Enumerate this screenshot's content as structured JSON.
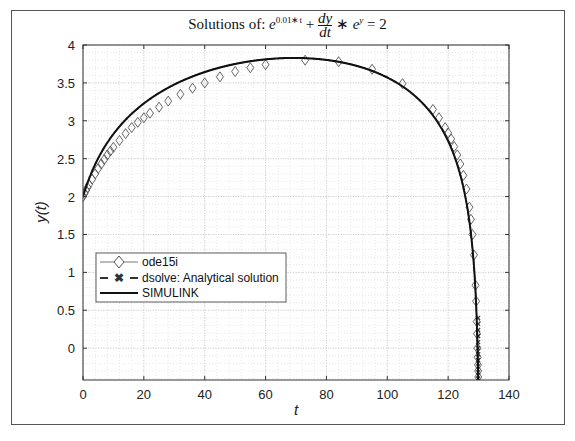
{
  "chart_data": {
    "type": "line",
    "title_parts": {
      "prefix": "Solutions of:",
      "e_base": "e",
      "exp1": "0.01∗t",
      "plus": "+",
      "num": "dy",
      "den": "dt",
      "times": "∗",
      "e2": "e",
      "exp2": "y",
      "eq": "= 2"
    },
    "xlabel": "t",
    "ylabel": "y(t)",
    "xlim": [
      0,
      140
    ],
    "ylim": [
      -0.42,
      4
    ],
    "xticks": [
      0,
      20,
      40,
      60,
      80,
      100,
      120,
      140
    ],
    "yticks": [
      0,
      0.5,
      1,
      1.5,
      2,
      2.5,
      3,
      3.5,
      4
    ],
    "ytick_labels": [
      "0",
      "0.5",
      "1",
      "1.5",
      "2",
      "2.5",
      "3",
      "3.5",
      "4"
    ],
    "grid": true,
    "minor_grid": true,
    "legend_position": "lower-left inside",
    "analytic_formula": "y = ln(2t - 100*e^(0.01t) + e^2 + 100)",
    "series": [
      {
        "name": "ode15i",
        "style": "thin gray line with diamond markers",
        "color": "#555555",
        "x": [
          0,
          0.5,
          1,
          1.5,
          2,
          3,
          4,
          5,
          6,
          7,
          8,
          9,
          10,
          12,
          14,
          16,
          18,
          20,
          22,
          25,
          28,
          32,
          36,
          40,
          45,
          50,
          55,
          60,
          73,
          84,
          95,
          105,
          115,
          117,
          119,
          120,
          121,
          122,
          123,
          124,
          125,
          126,
          127,
          127.5,
          128,
          128.5,
          129,
          129.2,
          129.4,
          129.5,
          129.6,
          129.7,
          129.8,
          129.85,
          129.9
        ],
        "y": [
          2.0,
          2.04,
          2.08,
          2.12,
          2.16,
          2.23,
          2.3,
          2.37,
          2.43,
          2.49,
          2.55,
          2.6,
          2.65,
          2.74,
          2.83,
          2.91,
          2.98,
          3.04,
          3.1,
          3.18,
          3.26,
          3.35,
          3.43,
          3.5,
          3.58,
          3.65,
          3.7,
          3.74,
          3.8,
          3.78,
          3.68,
          3.49,
          3.15,
          3.04,
          2.91,
          2.84,
          2.76,
          2.66,
          2.55,
          2.43,
          2.28,
          2.1,
          1.86,
          1.7,
          1.5,
          1.23,
          0.83,
          0.62,
          0.35,
          0.19,
          0.0,
          -0.12,
          -0.22,
          -0.3,
          -0.38
        ]
      },
      {
        "name": "dsolve: Analytical solution",
        "style": "dashed with x markers",
        "color": "#333333",
        "x": [
          0,
          10,
          20,
          40,
          60,
          70,
          80,
          100,
          110,
          120,
          125,
          128,
          129,
          129.5,
          129.8,
          129.9
        ],
        "y": [
          2.0,
          2.826,
          3.229,
          3.643,
          3.811,
          3.829,
          3.803,
          3.571,
          3.296,
          2.733,
          2.123,
          1.316,
          0.751,
          0.26,
          -0.22,
          -0.42
        ]
      },
      {
        "name": "SIMULINK",
        "style": "thick solid black line",
        "color": "#111111",
        "x": [
          0,
          10,
          20,
          40,
          60,
          70,
          80,
          100,
          110,
          120,
          125,
          128,
          129,
          129.5,
          129.8,
          129.9
        ],
        "y": [
          2.0,
          2.826,
          3.229,
          3.643,
          3.811,
          3.829,
          3.803,
          3.571,
          3.296,
          2.733,
          2.123,
          1.316,
          0.751,
          0.26,
          -0.22,
          -0.42
        ]
      }
    ],
    "legend": [
      "ode15i",
      "dsolve: Analytical solution",
      "SIMULINK"
    ]
  }
}
